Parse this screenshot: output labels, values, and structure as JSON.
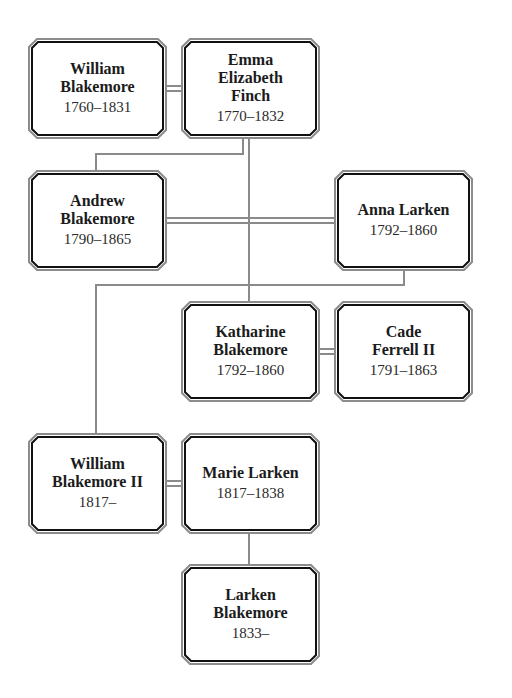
{
  "diagram": {
    "type": "family-tree",
    "line_color": "#8a8a8a",
    "box_border_outer": "#8c8c8c",
    "box_border_inner": "#111111",
    "people": [
      {
        "id": "william-blakemore",
        "name": "William Blakemore",
        "name_lines": [
          "William",
          "Blakemore"
        ],
        "dates": "1760–1831"
      },
      {
        "id": "emma-elizabeth-finch",
        "name": "Emma Elizabeth Finch",
        "name_lines": [
          "Emma",
          "Elizabeth",
          "Finch"
        ],
        "dates": "1770–1832"
      },
      {
        "id": "andrew-blakemore",
        "name": "Andrew Blakemore",
        "name_lines": [
          "Andrew",
          "Blakemore"
        ],
        "dates": "1790–1865"
      },
      {
        "id": "anna-larken",
        "name": "Anna Larken",
        "name_lines": [
          "Anna Larken"
        ],
        "dates": "1792–1860"
      },
      {
        "id": "katharine-blakemore",
        "name": "Katharine Blakemore",
        "name_lines": [
          "Katharine",
          "Blakemore"
        ],
        "dates": "1792–1860"
      },
      {
        "id": "cade-ferrell-ii",
        "name": "Cade Ferrell II",
        "name_lines": [
          "Cade",
          "Ferrell II"
        ],
        "dates": "1791–1863"
      },
      {
        "id": "william-blakemore-ii",
        "name": "William Blakemore II",
        "name_lines": [
          "William",
          "Blakemore II"
        ],
        "dates": "1817–"
      },
      {
        "id": "marie-larken",
        "name": "Marie Larken",
        "name_lines": [
          "Marie Larken"
        ],
        "dates": "1817–1838"
      },
      {
        "id": "larken-blakemore",
        "name": "Larken Blakemore",
        "name_lines": [
          "Larken",
          "Blakemore"
        ],
        "dates": "1833–"
      }
    ],
    "marriages": [
      [
        "william-blakemore",
        "emma-elizabeth-finch"
      ],
      [
        "andrew-blakemore",
        "anna-larken"
      ],
      [
        "katharine-blakemore",
        "cade-ferrell-ii"
      ],
      [
        "william-blakemore-ii",
        "marie-larken"
      ]
    ],
    "children": [
      {
        "parents": [
          "william-blakemore",
          "emma-elizabeth-finch"
        ],
        "children": [
          "andrew-blakemore",
          "katharine-blakemore"
        ]
      },
      {
        "parents": [
          "andrew-blakemore",
          "anna-larken"
        ],
        "children": [
          "william-blakemore-ii"
        ]
      },
      {
        "parents": [
          "william-blakemore-ii",
          "marie-larken"
        ],
        "children": [
          "larken-blakemore"
        ]
      }
    ]
  }
}
